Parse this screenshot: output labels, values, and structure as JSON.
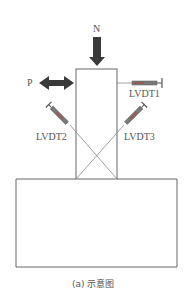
{
  "diagram": {
    "labels": {
      "axial_load": "N",
      "lateral_load": "P",
      "lvdt1": "LVDT1",
      "lvdt2": "LVDT2",
      "lvdt3": "LVDT3"
    },
    "caption": "(a) 示意图",
    "colors": {
      "outline": "#666666",
      "arrow_fill": "#3a3a3a",
      "sensor_body": "#7a7a7a",
      "sensor_accent": "#b0463a",
      "text": "#555555"
    }
  }
}
